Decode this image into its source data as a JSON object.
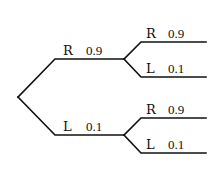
{
  "diagram": {
    "type": "probability-tree",
    "root": {
      "children": [
        {
          "label": "R",
          "prob": "0.9",
          "children": [
            {
              "label": "R",
              "prob": "0.9"
            },
            {
              "label": "L",
              "prob": "0.1"
            }
          ]
        },
        {
          "label": "L",
          "prob": "0.1",
          "children": [
            {
              "label": "R",
              "prob": "0.9"
            },
            {
              "label": "L",
              "prob": "0.1"
            }
          ]
        }
      ]
    },
    "colors": {
      "line": "#111111",
      "text": "#111111",
      "background": "#ffffff"
    }
  }
}
